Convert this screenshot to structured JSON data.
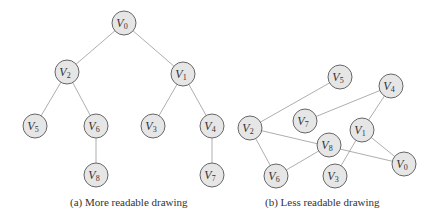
{
  "colors": {
    "node_fill": "#e6e6e6",
    "node_stroke": "#666666",
    "edge": "#999999",
    "text": "#333333"
  },
  "diagrams": [
    {
      "caption": "(a)  More readable drawing",
      "caption_pos": [
        70,
        196
      ],
      "nodes": [
        {
          "id": "V0",
          "label": "V",
          "sub": "0",
          "x": 124,
          "y": 23
        },
        {
          "id": "V2",
          "label": "V",
          "sub": "2",
          "x": 67,
          "y": 72
        },
        {
          "id": "V1",
          "label": "V",
          "sub": "1",
          "x": 183,
          "y": 74
        },
        {
          "id": "V5",
          "label": "V",
          "sub": "5",
          "x": 35,
          "y": 126
        },
        {
          "id": "V6",
          "label": "V",
          "sub": "6",
          "x": 96,
          "y": 126
        },
        {
          "id": "V3",
          "label": "V",
          "sub": "3",
          "x": 153,
          "y": 126
        },
        {
          "id": "V4",
          "label": "V",
          "sub": "4",
          "x": 212,
          "y": 126
        },
        {
          "id": "V8",
          "label": "V",
          "sub": "8",
          "x": 96,
          "y": 175
        },
        {
          "id": "V7",
          "label": "V",
          "sub": "7",
          "x": 212,
          "y": 175
        }
      ],
      "edges": [
        [
          "V0",
          "V2"
        ],
        [
          "V0",
          "V1"
        ],
        [
          "V2",
          "V5"
        ],
        [
          "V2",
          "V6"
        ],
        [
          "V6",
          "V8"
        ],
        [
          "V1",
          "V3"
        ],
        [
          "V1",
          "V4"
        ],
        [
          "V4",
          "V7"
        ]
      ]
    },
    {
      "caption": "(b)  Less readable drawing",
      "caption_pos": [
        265,
        196
      ],
      "nodes": [
        {
          "id": "V5",
          "label": "V",
          "sub": "5",
          "x": 340,
          "y": 77
        },
        {
          "id": "V4",
          "label": "V",
          "sub": "4",
          "x": 391,
          "y": 86
        },
        {
          "id": "V2",
          "label": "V",
          "sub": "2",
          "x": 250,
          "y": 128
        },
        {
          "id": "V7",
          "label": "V",
          "sub": "7",
          "x": 305,
          "y": 121
        },
        {
          "id": "V1",
          "label": "V",
          "sub": "1",
          "x": 362,
          "y": 130
        },
        {
          "id": "V8",
          "label": "V",
          "sub": "8",
          "x": 329,
          "y": 145
        },
        {
          "id": "V0",
          "label": "V",
          "sub": "0",
          "x": 404,
          "y": 164
        },
        {
          "id": "V6",
          "label": "V",
          "sub": "6",
          "x": 276,
          "y": 176
        },
        {
          "id": "V3",
          "label": "V",
          "sub": "3",
          "x": 335,
          "y": 176
        }
      ],
      "edges": [
        [
          "V2",
          "V5"
        ],
        [
          "V2",
          "V0"
        ],
        [
          "V2",
          "V6"
        ],
        [
          "V6",
          "V8"
        ],
        [
          "V7",
          "V4"
        ],
        [
          "V4",
          "V1"
        ],
        [
          "V1",
          "V0"
        ],
        [
          "V1",
          "V3"
        ]
      ]
    }
  ]
}
